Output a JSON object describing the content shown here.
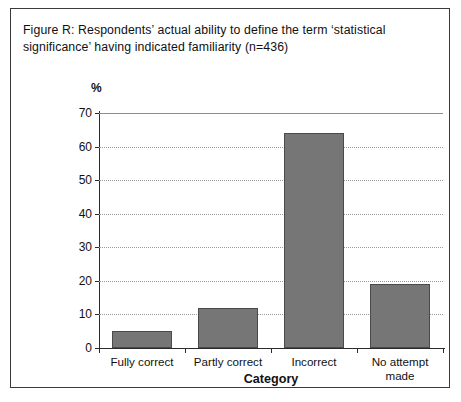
{
  "figure": {
    "caption": "Figure R: Respondents’ actual ability to define the term ‘statistical significance’ having indicated familiarity (n=436)",
    "border_color": "#3a3a3a"
  },
  "chart_data": {
    "type": "bar",
    "title": "Figure R: Respondents’ actual ability to define the term ‘statistical significance’ having indicated familiarity (n=436)",
    "categories": [
      "Fully correct",
      "Partly correct",
      "Incorrect",
      "No attempt made"
    ],
    "values": [
      5,
      12,
      64,
      19
    ],
    "xlabel": "Category",
    "ylabel": "%",
    "ylim": [
      0,
      70
    ],
    "yticks": [
      0,
      10,
      20,
      30,
      40,
      50,
      60,
      70
    ],
    "ytick_labels": [
      "0",
      "10",
      "20",
      "30",
      "40",
      "50",
      "60",
      "70"
    ],
    "grid": true,
    "grid_axis": "y",
    "legend": false,
    "bar_color": "#767676",
    "bar_edge_color": "#4a4a4a",
    "n": 436
  }
}
